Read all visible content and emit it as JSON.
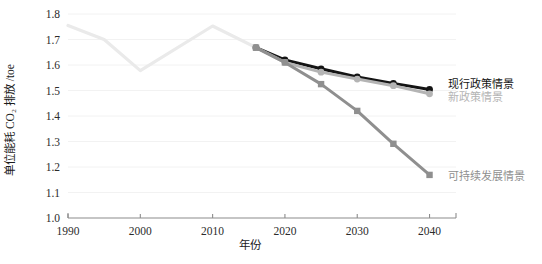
{
  "chart_data": {
    "type": "line",
    "title": "",
    "xlabel": "年份",
    "ylabel": "单位能耗 CO₂ 排放 /toe",
    "xlim": [
      1990,
      2042
    ],
    "ylim": [
      1.0,
      1.8
    ],
    "yticks": [
      "1.0",
      "1.1",
      "1.2",
      "1.3",
      "1.4",
      "1.5",
      "1.6",
      "1.7",
      "1.8"
    ],
    "ytick_values": [
      1.0,
      1.1,
      1.2,
      1.3,
      1.4,
      1.5,
      1.6,
      1.7,
      1.8
    ],
    "xticks": [
      "1990",
      "2000",
      "2010",
      "2020",
      "2030",
      "2040"
    ],
    "xtick_values": [
      1990,
      2000,
      2010,
      2020,
      2030,
      2040
    ],
    "grid": true,
    "legend_position": "right-inline",
    "series": [
      {
        "name": "历史",
        "label": "",
        "color": "#eaeaea",
        "marker": "none",
        "line_width": 3.2,
        "show_label": false,
        "x": [
          1990,
          1995,
          2000,
          2010,
          2016
        ],
        "values": [
          1.755,
          1.7,
          1.578,
          1.753,
          1.668
        ]
      },
      {
        "name": "现行政策情景",
        "label": "现行政策情景",
        "color": "#141414",
        "marker": "circle",
        "line_width": 3.0,
        "show_label": true,
        "label_x": 448,
        "label_y": 88,
        "x": [
          2016,
          2020,
          2025,
          2030,
          2035,
          2040
        ],
        "values": [
          1.668,
          1.62,
          1.585,
          1.553,
          1.528,
          1.504
        ]
      },
      {
        "name": "新政策情景",
        "label": "新政策情景",
        "color": "#b4b4b4",
        "marker": "circle",
        "line_width": 3.0,
        "show_label": true,
        "label_x": 448,
        "label_y": 101,
        "x": [
          2016,
          2020,
          2025,
          2030,
          2035,
          2040
        ],
        "values": [
          1.668,
          1.61,
          1.572,
          1.545,
          1.519,
          1.487
        ]
      },
      {
        "name": "可持续发展情景",
        "label": "可持续发展情景",
        "color": "#8f8f8f",
        "marker": "square",
        "line_width": 3.0,
        "show_label": true,
        "label_x": 448,
        "label_y": 180,
        "x": [
          2016,
          2020,
          2025,
          2030,
          2035,
          2040
        ],
        "values": [
          1.668,
          1.61,
          1.525,
          1.42,
          1.291,
          1.169
        ]
      }
    ]
  }
}
